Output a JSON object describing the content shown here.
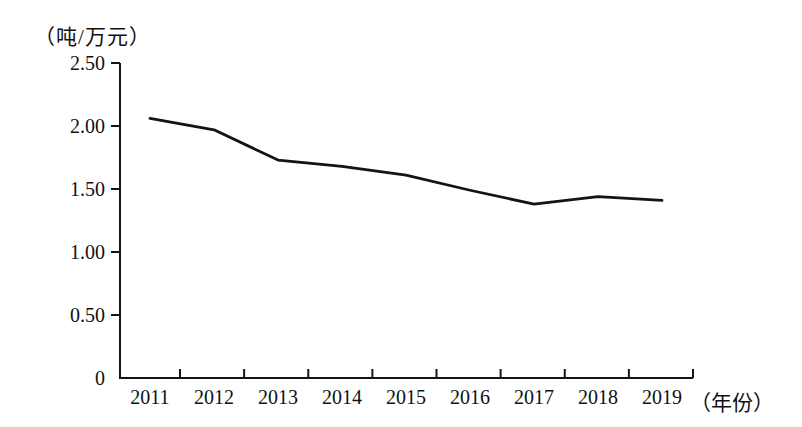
{
  "chart_data": {
    "type": "line",
    "title": "",
    "unit_label": "（吨/万元）",
    "x_axis_label": "（年份）",
    "categories": [
      "2011",
      "2012",
      "2013",
      "2014",
      "2015",
      "2016",
      "2017",
      "2018",
      "2019"
    ],
    "series": [
      {
        "name": "tons-per-10k-yuan",
        "values": [
          2.06,
          1.97,
          1.73,
          1.68,
          1.61,
          1.49,
          1.38,
          1.44,
          1.41
        ]
      }
    ],
    "y_ticks": [
      "2.50",
      "2.00",
      "1.50",
      "1.00",
      "0.50",
      "0"
    ],
    "ylim": [
      0,
      2.5
    ],
    "grid": false,
    "legend": "none",
    "line_color": "#141414",
    "axis_color": "#141414",
    "background_color": "#ffffff"
  }
}
